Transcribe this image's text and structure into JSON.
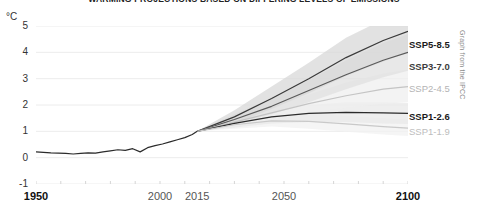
{
  "chart_data": {
    "type": "line",
    "title": "WARMING PROJECTIONS BASED ON DIFFERING LEVELS OF EMISSIONS",
    "xlabel": "",
    "ylabel": "°C",
    "unit": "°C",
    "xlim": [
      1950,
      2100
    ],
    "ylim": [
      -1,
      5
    ],
    "grid": true,
    "legend_position": "right",
    "attribution": "Graph from the IPCC",
    "xticks": [
      {
        "value": 1950,
        "label": "1950",
        "emphasis": "bold"
      },
      {
        "value": 2000,
        "label": "2000",
        "emphasis": "normal"
      },
      {
        "value": 2015,
        "label": "2015",
        "emphasis": "normal"
      },
      {
        "value": 2050,
        "label": "2050",
        "emphasis": "normal"
      },
      {
        "value": 2100,
        "label": "2100",
        "emphasis": "bold"
      }
    ],
    "yticks": [
      {
        "value": 5,
        "label": "5"
      },
      {
        "value": 4,
        "label": "4"
      },
      {
        "value": 3,
        "label": "3"
      },
      {
        "value": 2,
        "label": "2"
      },
      {
        "value": 1,
        "label": "1"
      },
      {
        "value": 0,
        "label": "0"
      },
      {
        "value": -1,
        "label": "-1"
      }
    ],
    "branch_year": 2015,
    "historical": {
      "name": "Observed warming",
      "color": "#2b2b2b",
      "x": [
        1950,
        1953,
        1956,
        1959,
        1962,
        1965,
        1968,
        1971,
        1974,
        1977,
        1980,
        1983,
        1986,
        1989,
        1992,
        1995,
        1998,
        2001,
        2004,
        2007,
        2010,
        2013,
        2015
      ],
      "y": [
        0.22,
        0.2,
        0.18,
        0.17,
        0.16,
        0.14,
        0.16,
        0.18,
        0.17,
        0.22,
        0.26,
        0.3,
        0.28,
        0.34,
        0.22,
        0.38,
        0.46,
        0.52,
        0.6,
        0.68,
        0.76,
        0.88,
        1.0
      ]
    },
    "series": [
      {
        "name": "SSP5-8.5",
        "label": "SSP5-8.5",
        "color": "#3a3a3a",
        "band_color": "#d8d8d8",
        "legend_style": "dark",
        "legend_y": 40,
        "x": [
          2015,
          2030,
          2045,
          2060,
          2075,
          2090,
          2100
        ],
        "values": [
          1.0,
          1.55,
          2.25,
          3.0,
          3.8,
          4.45,
          4.8
        ],
        "band_low": [
          1.0,
          1.3,
          1.85,
          2.45,
          3.1,
          3.65,
          4.0
        ],
        "band_high": [
          1.0,
          1.8,
          2.7,
          3.6,
          4.55,
          5.25,
          5.6
        ]
      },
      {
        "name": "SSP3-7.0",
        "label": "SSP3-7.0",
        "color": "#5a5a5a",
        "band_color": "#e0e0e0",
        "legend_style": "mid",
        "legend_y": 62,
        "x": [
          2015,
          2030,
          2045,
          2060,
          2075,
          2090,
          2100
        ],
        "values": [
          1.0,
          1.45,
          1.95,
          2.55,
          3.15,
          3.7,
          4.0
        ],
        "band_low": [
          1.0,
          1.25,
          1.65,
          2.1,
          2.6,
          3.05,
          3.3
        ],
        "band_high": [
          1.0,
          1.65,
          2.25,
          2.95,
          3.7,
          4.35,
          4.7
        ]
      },
      {
        "name": "SSP2-4.5",
        "label": "SSP2-4.5",
        "color": "#c4c4c4",
        "band_color": "#efefef",
        "legend_style": "faint",
        "legend_y": 84,
        "x": [
          2015,
          2030,
          2045,
          2060,
          2075,
          2090,
          2100
        ],
        "values": [
          1.0,
          1.35,
          1.7,
          2.05,
          2.35,
          2.6,
          2.7
        ],
        "band_low": [
          1.0,
          1.2,
          1.45,
          1.7,
          1.9,
          2.05,
          2.1
        ],
        "band_high": [
          1.0,
          1.5,
          1.95,
          2.4,
          2.85,
          3.2,
          3.35
        ]
      },
      {
        "name": "SSP1-2.6",
        "label": "SSP1-2.6",
        "color": "#2b2b2b",
        "band_color": "#e8e8e8",
        "legend_style": "dark",
        "legend_y": 112,
        "x": [
          2015,
          2030,
          2045,
          2060,
          2075,
          2090,
          2100
        ],
        "values": [
          1.0,
          1.3,
          1.55,
          1.68,
          1.72,
          1.7,
          1.68
        ],
        "band_low": [
          1.0,
          1.15,
          1.3,
          1.35,
          1.35,
          1.3,
          1.28
        ],
        "band_high": [
          1.0,
          1.45,
          1.8,
          2.0,
          2.1,
          2.1,
          2.08
        ]
      },
      {
        "name": "SSP1-1.9",
        "label": "SSP1-1.9",
        "color": "#c9c9c9",
        "band_color": "#f2f2f2",
        "legend_style": "faint2",
        "legend_y": 127,
        "x": [
          2015,
          2030,
          2045,
          2060,
          2075,
          2090,
          2100
        ],
        "values": [
          1.0,
          1.25,
          1.4,
          1.38,
          1.28,
          1.18,
          1.12
        ],
        "band_low": [
          1.0,
          1.1,
          1.18,
          1.1,
          0.98,
          0.88,
          0.82
        ],
        "band_high": [
          1.0,
          1.4,
          1.62,
          1.66,
          1.58,
          1.5,
          1.45
        ]
      }
    ]
  }
}
